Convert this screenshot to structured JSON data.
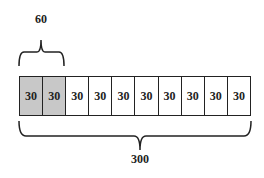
{
  "diagram": {
    "top_brace": {
      "label": "60",
      "spans_cells": 2
    },
    "bottom_brace": {
      "label": "300",
      "spans_cells": 10
    },
    "cells": [
      {
        "value": "30",
        "shaded": true
      },
      {
        "value": "30",
        "shaded": true
      },
      {
        "value": "30",
        "shaded": false
      },
      {
        "value": "30",
        "shaded": false
      },
      {
        "value": "30",
        "shaded": false
      },
      {
        "value": "30",
        "shaded": false
      },
      {
        "value": "30",
        "shaded": false
      },
      {
        "value": "30",
        "shaded": false
      },
      {
        "value": "30",
        "shaded": false
      },
      {
        "value": "30",
        "shaded": false
      }
    ],
    "colors": {
      "shaded": "#c8c8c8",
      "line": "#222222"
    }
  }
}
